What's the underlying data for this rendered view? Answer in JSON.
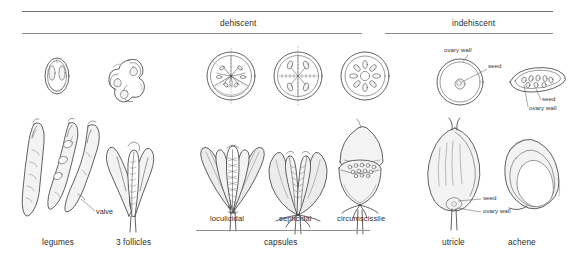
{
  "plate": {
    "title_top_group": "dehiscent",
    "title_top_group_right": "indehiscent",
    "bottom_group_capsules": "capsules"
  },
  "headers": [
    {
      "label": "dehiscent"
    },
    {
      "label": "indehiscent"
    }
  ],
  "figures": [
    {
      "name": "legumes",
      "label": "legumes"
    },
    {
      "name": "follicles",
      "label": "3 follicles"
    },
    {
      "name": "loculicidal",
      "label": "loculicidal"
    },
    {
      "name": "septicidal",
      "label": "septicidal"
    },
    {
      "name": "circumscissile",
      "label": "circumscissile"
    },
    {
      "name": "utricle",
      "label": "utricle"
    },
    {
      "name": "achene",
      "label": "achene"
    }
  ],
  "callouts": {
    "valve": "valve",
    "ovary_wall_1": "ovary wall",
    "seed_1": "seed",
    "seed_2": "seed",
    "ovary_wall_2": "ovary wall",
    "seed_3": "seed",
    "ovary_wall_3": "ovary  wall"
  },
  "groups": {
    "capsules": "capsules"
  },
  "colors": {
    "ink": "#3a3a3a",
    "rule": "#8e8e8e",
    "paper": "#ffffff",
    "text": "#2e2e2e"
  }
}
